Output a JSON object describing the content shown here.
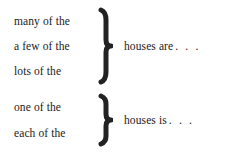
{
  "diagram": {
    "background_color": "#ffffff",
    "text_color": "#1a1a1a",
    "brace_color": "#222222",
    "groups": [
      {
        "id": "plural",
        "brace_icon": "right-curly-brace-icon",
        "phrases": [
          "many of the",
          "a few of the",
          "lots of the"
        ],
        "result": "houses are",
        "ellipsis": ". . ."
      },
      {
        "id": "singular",
        "brace_icon": "right-curly-brace-icon",
        "phrases": [
          "one of the",
          "each of the"
        ],
        "result": "houses is",
        "ellipsis": ". . ."
      }
    ]
  }
}
